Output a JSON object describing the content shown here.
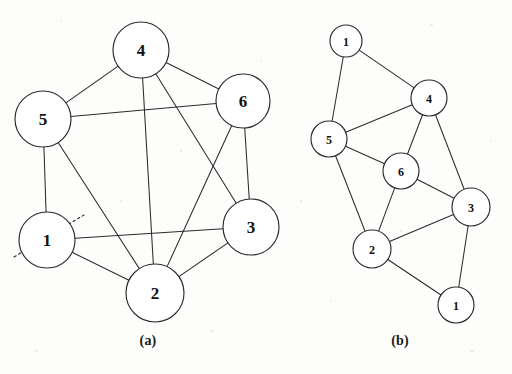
{
  "figure": {
    "width": 512,
    "height": 374,
    "background_color": "#fdfdfc",
    "stroke_color": "#2b2b2b",
    "label_color": "#111111"
  },
  "panels": [
    {
      "id": "a",
      "caption": "(a)",
      "caption_x": 148,
      "caption_y": 341,
      "layout": "circular",
      "node_radius": 27,
      "node_font_size": 17,
      "nodes": [
        {
          "id": "a4",
          "label": "4",
          "x": 141,
          "y": 50,
          "r": 28
        },
        {
          "id": "a5",
          "label": "5",
          "x": 43,
          "y": 119,
          "r": 28
        },
        {
          "id": "a6",
          "label": "6",
          "x": 243,
          "y": 101,
          "r": 27
        },
        {
          "id": "a3",
          "label": "3",
          "x": 251,
          "y": 227,
          "r": 28
        },
        {
          "id": "a1",
          "label": "1",
          "x": 47,
          "y": 240,
          "r": 28
        },
        {
          "id": "a2",
          "label": "2",
          "x": 155,
          "y": 293,
          "r": 29
        }
      ],
      "edges": [
        {
          "from": "a5",
          "to": "a4"
        },
        {
          "from": "a4",
          "to": "a6"
        },
        {
          "from": "a5",
          "to": "a6"
        },
        {
          "from": "a5",
          "to": "a1"
        },
        {
          "from": "a6",
          "to": "a3"
        },
        {
          "from": "a1",
          "to": "a3"
        },
        {
          "from": "a1",
          "to": "a2"
        },
        {
          "from": "a2",
          "to": "a3"
        },
        {
          "from": "a4",
          "to": "a2"
        },
        {
          "from": "a4",
          "to": "a3"
        },
        {
          "from": "a5",
          "to": "a2"
        },
        {
          "from": "a6",
          "to": "a2"
        }
      ],
      "cut_line": {
        "name": "partition-cut-line",
        "x1": 14,
        "y1": 257,
        "x2": 84,
        "y2": 215,
        "style": "dashed"
      }
    },
    {
      "id": "b",
      "caption": "(b)",
      "caption_x": 400,
      "caption_y": 341,
      "layout": "free",
      "node_radius": 17,
      "node_font_size": 12,
      "nodes": [
        {
          "id": "b1t",
          "label": "1",
          "x": 346,
          "y": 41,
          "r": 16
        },
        {
          "id": "b4",
          "label": "4",
          "x": 429,
          "y": 98,
          "r": 18
        },
        {
          "id": "b5",
          "label": "5",
          "x": 329,
          "y": 139,
          "r": 18
        },
        {
          "id": "b6",
          "label": "6",
          "x": 401,
          "y": 171,
          "r": 18
        },
        {
          "id": "b3",
          "label": "3",
          "x": 471,
          "y": 207,
          "r": 19
        },
        {
          "id": "b2",
          "label": "2",
          "x": 372,
          "y": 249,
          "r": 19
        },
        {
          "id": "b1b",
          "label": "1",
          "x": 456,
          "y": 305,
          "r": 18
        }
      ],
      "edges": [
        {
          "from": "b1t",
          "to": "b4"
        },
        {
          "from": "b1t",
          "to": "b5"
        },
        {
          "from": "b5",
          "to": "b4"
        },
        {
          "from": "b5",
          "to": "b6"
        },
        {
          "from": "b5",
          "to": "b2"
        },
        {
          "from": "b4",
          "to": "b6"
        },
        {
          "from": "b4",
          "to": "b3"
        },
        {
          "from": "b6",
          "to": "b2"
        },
        {
          "from": "b6",
          "to": "b3"
        },
        {
          "from": "b2",
          "to": "b3"
        },
        {
          "from": "b2",
          "to": "b1b"
        },
        {
          "from": "b3",
          "to": "b1b"
        }
      ]
    }
  ]
}
